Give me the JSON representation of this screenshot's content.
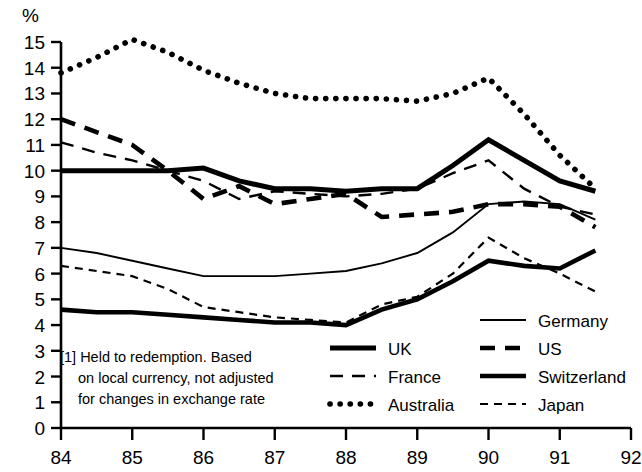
{
  "chart_data": {
    "type": "line",
    "title": "",
    "ylabel": "%",
    "xlabel": "",
    "xlim": [
      84,
      92
    ],
    "ylim": [
      0,
      15
    ],
    "grid": false,
    "legend_position": "inside-bottom-right",
    "x_ticks": [
      "84",
      "85",
      "86",
      "87",
      "88",
      "89",
      "90",
      "91",
      "92"
    ],
    "y_ticks": [
      "0",
      "1",
      "2",
      "3",
      "4",
      "5",
      "6",
      "7",
      "8",
      "9",
      "10",
      "11",
      "12",
      "13",
      "14",
      "15"
    ],
    "x": [
      84,
      84.5,
      85,
      85.5,
      86,
      86.5,
      87,
      87.5,
      88,
      88.5,
      89,
      89.5,
      90,
      90.5,
      91,
      91.5
    ],
    "series": [
      {
        "name": "UK",
        "style": "solid-thick",
        "values": [
          10.0,
          10.0,
          10.0,
          10.0,
          10.1,
          9.6,
          9.3,
          9.3,
          9.2,
          9.3,
          9.3,
          10.2,
          11.2,
          10.4,
          9.6,
          9.2
        ]
      },
      {
        "name": "France",
        "style": "dashed-medium",
        "values": [
          11.1,
          10.7,
          10.4,
          10.0,
          9.6,
          8.9,
          9.2,
          9.1,
          9.0,
          9.1,
          9.3,
          9.9,
          10.4,
          9.3,
          8.6,
          8.3
        ]
      },
      {
        "name": "Australia",
        "style": "dotted-thick",
        "values": [
          13.8,
          14.4,
          15.1,
          14.6,
          13.9,
          13.4,
          13.0,
          12.8,
          12.8,
          12.8,
          12.7,
          13.0,
          13.6,
          12.2,
          10.6,
          9.3
        ]
      },
      {
        "name": "Germany",
        "style": "solid-thin",
        "values": [
          7.0,
          6.8,
          6.5,
          6.2,
          5.9,
          5.9,
          5.9,
          6.0,
          6.1,
          6.4,
          6.8,
          7.6,
          8.7,
          8.8,
          8.7,
          8.1
        ]
      },
      {
        "name": "US",
        "style": "dashed-thick",
        "values": [
          12.0,
          11.5,
          11.0,
          10.0,
          8.9,
          9.4,
          8.7,
          8.9,
          9.1,
          8.2,
          8.3,
          8.4,
          8.7,
          8.7,
          8.6,
          7.8
        ]
      },
      {
        "name": "Switzerland",
        "style": "solid-thick-low",
        "values": [
          4.6,
          4.5,
          4.5,
          4.4,
          4.3,
          4.2,
          4.1,
          4.1,
          4.0,
          4.6,
          5.0,
          5.7,
          6.5,
          6.3,
          6.2,
          6.9
        ]
      },
      {
        "name": "Japan",
        "style": "dashed-fine",
        "values": [
          6.3,
          6.1,
          5.9,
          5.4,
          4.7,
          4.5,
          4.3,
          4.2,
          4.1,
          4.8,
          5.1,
          6.0,
          7.4,
          6.6,
          6.0,
          5.3
        ]
      }
    ],
    "annotations": [
      {
        "id": "footnote",
        "lines": [
          "[1]  Held to redemption. Based",
          "on local currency, not adjusted",
          "for changes in exchange rate"
        ]
      }
    ]
  },
  "legend": {
    "column_left": [
      {
        "label": "UK",
        "style": "solid-thick"
      },
      {
        "label": "France",
        "style": "dashed-medium"
      },
      {
        "label": "Australia",
        "style": "dotted-thick"
      }
    ],
    "column_right": [
      {
        "label": "Germany",
        "style": "solid-thin"
      },
      {
        "label": "US",
        "style": "dashed-thick"
      },
      {
        "label": "Switzerland",
        "style": "solid-thick-low"
      },
      {
        "label": "Japan",
        "style": "dashed-fine"
      }
    ]
  },
  "colors": {
    "ink": "#000000",
    "background": "#ffffff"
  }
}
